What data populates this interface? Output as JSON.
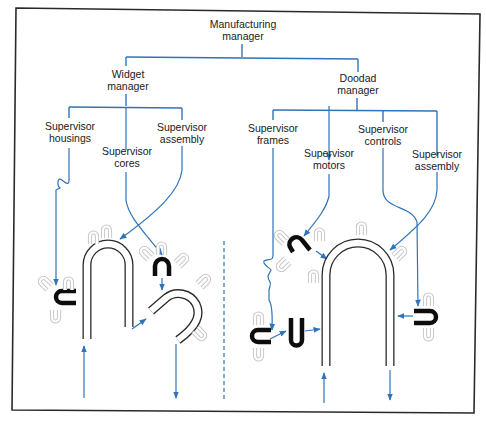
{
  "diagram": {
    "colors": {
      "line": "#2f73b8",
      "frame": "#2a2a2a",
      "part": "#0d0d0d",
      "ghost": "#c8c8c8"
    },
    "nodes": {
      "manufacturing_manager": {
        "line1": "Manufacturing",
        "line2": "manager"
      },
      "widget_manager": {
        "line1": "Widget",
        "line2": "manager"
      },
      "doodad_manager": {
        "line1": "Doodad",
        "line2": "manager"
      },
      "widget_supervisors": [
        {
          "line1": "Supervisor",
          "line2": "housings"
        },
        {
          "line1": "Supervisor",
          "line2": "cores"
        },
        {
          "line1": "Supervisor",
          "line2": "assembly"
        }
      ],
      "doodad_supervisors": [
        {
          "line1": "Supervisor",
          "line2": "frames"
        },
        {
          "line1": "Supervisor",
          "line2": "motors"
        },
        {
          "line1": "Supervisor",
          "line2": "controls"
        },
        {
          "line1": "Supervisor",
          "line2": "assembly"
        }
      ]
    },
    "sections": {
      "left": "Widget production (housings, cores, assembly)",
      "right": "Doodad production (frames, motors, controls, assembly)"
    }
  }
}
